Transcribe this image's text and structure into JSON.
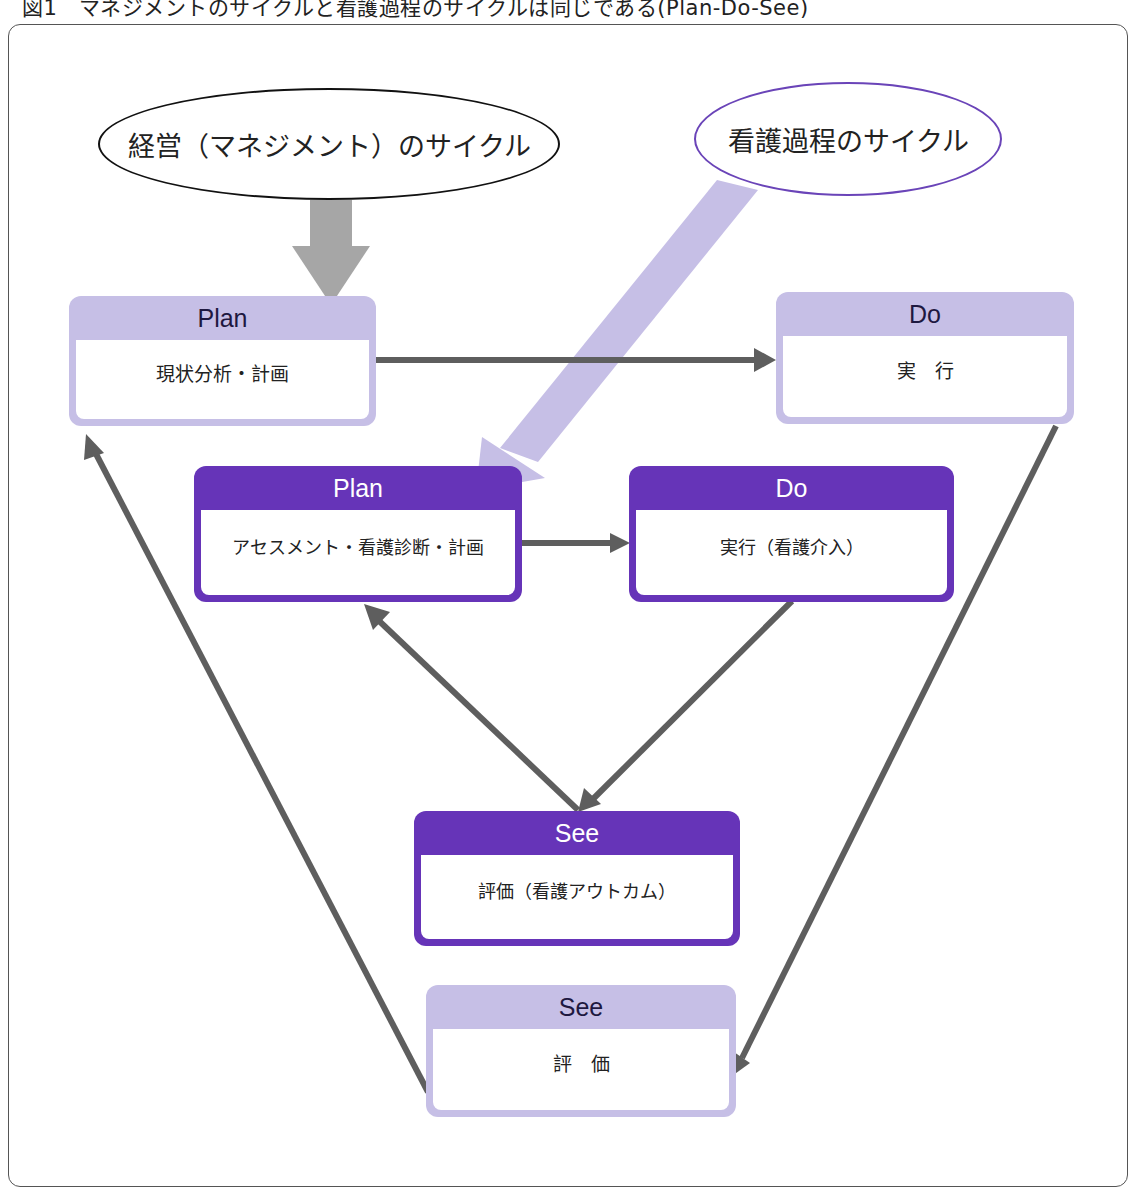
{
  "figure": {
    "caption": "図1　マネジメントのサイクルと看護過程のサイクルは同じである(Plan-Do-See)"
  },
  "ellipses": {
    "management_cycle": "経営（マネジメント）のサイクル",
    "nursing_process_cycle": "看護過程のサイクル"
  },
  "management_cycle": {
    "plan": {
      "header": "Plan",
      "body": "現状分析・計画"
    },
    "do": {
      "header": "Do",
      "body": "実　行"
    },
    "see": {
      "header": "See",
      "body": "評　価"
    }
  },
  "nursing_cycle": {
    "plan": {
      "header": "Plan",
      "body": "アセスメント・看護診断・計画"
    },
    "do": {
      "header": "Do",
      "body": "実行（看護介入）"
    },
    "see": {
      "header": "See",
      "body": "評価（看護アウトカム）"
    }
  },
  "colors": {
    "management_box": "#c6bfe6",
    "nursing_box": "#6634b8",
    "arrow": "#5e5e5e",
    "management_entry_arrow": "#a6a6a6",
    "nursing_entry_arrow": "#c6bfe6"
  },
  "connections": [
    {
      "from": "management_cycle_ellipse",
      "to": "management_plan"
    },
    {
      "from": "nursing_process_cycle_ellipse",
      "to": "nursing_plan"
    },
    {
      "from": "management_plan",
      "to": "management_do"
    },
    {
      "from": "management_do",
      "to": "management_see"
    },
    {
      "from": "management_see",
      "to": "management_plan"
    },
    {
      "from": "nursing_plan",
      "to": "nursing_do"
    },
    {
      "from": "nursing_do",
      "to": "nursing_see"
    },
    {
      "from": "nursing_see",
      "to": "nursing_plan"
    }
  ]
}
